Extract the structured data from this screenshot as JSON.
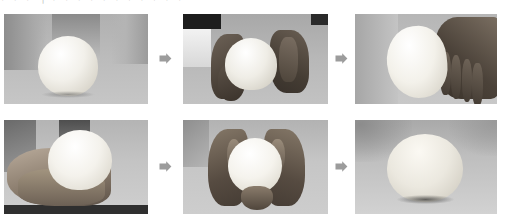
{
  "header": {
    "clipped_text": "⌐ ⌐ ⌐ ┐ ⌐ ⌐ ⌐ ⌐ ⌐ ⌐ ⌐ ⌐ ⌐ ⌐ ⌐",
    "note": "clipped illegible text row"
  },
  "figure": {
    "type": "photo-sequence",
    "layout": "2 rows x 3 columns",
    "background_color": "#ffffff",
    "arrow_color": "#9c9c9c",
    "arrow_glyph": "right-block-arrow"
  },
  "panels": [
    {
      "id": "r1c1",
      "row": 1,
      "col": 1,
      "caption": "Round dough ball resting on work surface",
      "x": 4,
      "y": 14,
      "w": 144,
      "h": 90,
      "bg_top": "#b0b0b0",
      "bg_bottom": "#c6c6c6",
      "dough": {
        "cx": 64,
        "cy": 52,
        "rx": 30,
        "ry": 30,
        "color": "#f2f0ea"
      }
    },
    {
      "id": "r1c2",
      "row": 1,
      "col": 2,
      "caption": "Two hands cupping and rounding the dough",
      "x": 183,
      "y": 14,
      "w": 145,
      "h": 90,
      "bg_top": "#a8a8a8",
      "bg_bottom": "#c2c2c2",
      "dough": {
        "cx": 68,
        "cy": 50,
        "rx": 26,
        "ry": 26,
        "color": "#efedE6"
      }
    },
    {
      "id": "r1c3",
      "row": 1,
      "col": 3,
      "caption": "Hand holding elongated oval dough",
      "x": 355,
      "y": 14,
      "w": 142,
      "h": 90,
      "bg_top": "#b6b6b6",
      "bg_bottom": "#c8c8c8",
      "dough": {
        "cx": 62,
        "cy": 48,
        "rx": 30,
        "ry": 36,
        "color": "#f3f1ea"
      }
    },
    {
      "id": "r2c1",
      "row": 2,
      "col": 1,
      "caption": "Hand cradling the dough from below",
      "x": 4,
      "y": 120,
      "w": 144,
      "h": 94,
      "bg_top": "#b4b4b4",
      "bg_bottom": "#cfcfcf",
      "dough": {
        "cx": 76,
        "cy": 40,
        "rx": 32,
        "ry": 30,
        "color": "#f4f2ec"
      }
    },
    {
      "id": "r2c2",
      "row": 2,
      "col": 2,
      "caption": "Both hands cupping dough into a sphere",
      "x": 183,
      "y": 120,
      "w": 145,
      "h": 94,
      "bg_top": "#b2b2b2",
      "bg_bottom": "#cdcdcd",
      "dough": {
        "cx": 72,
        "cy": 46,
        "rx": 27,
        "ry": 28,
        "color": "#f5f3ed"
      }
    },
    {
      "id": "r2c3",
      "row": 2,
      "col": 3,
      "caption": "Finished smooth round dough on surface",
      "x": 355,
      "y": 120,
      "w": 142,
      "h": 94,
      "bg_top": "#a9a9a9",
      "bg_bottom": "#d2d2d2",
      "dough": {
        "cx": 70,
        "cy": 48,
        "rx": 38,
        "ry": 34,
        "color": "#ebe8df"
      }
    }
  ],
  "arrows": [
    {
      "id": "arrow-r1-1",
      "x": 159,
      "y": 52,
      "from": "r1c1",
      "to": "r1c2"
    },
    {
      "id": "arrow-r1-2",
      "x": 335,
      "y": 52,
      "from": "r1c2",
      "to": "r1c3"
    },
    {
      "id": "arrow-r2-1",
      "x": 159,
      "y": 160,
      "from": "r2c1",
      "to": "r2c2"
    },
    {
      "id": "arrow-r2-2",
      "x": 335,
      "y": 160,
      "from": "r2c2",
      "to": "r2c3"
    }
  ]
}
